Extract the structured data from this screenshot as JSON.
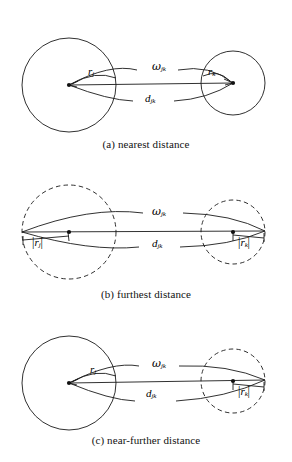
{
  "figure": {
    "type": "diagram",
    "background_color": "#ffffff",
    "stroke_color": "#1a1a1a"
  },
  "panels": [
    {
      "id": "a",
      "caption": "(a) nearest distance",
      "left_circle": {
        "style": "solid",
        "cx": 69,
        "cy": 85,
        "r": 47,
        "center_dot": true
      },
      "right_circle": {
        "style": "solid",
        "cx": 233,
        "cy": 83,
        "r": 32,
        "center_dot": true
      },
      "labels": {
        "left_radius": "r",
        "left_radius_sub": "j",
        "right_radius": "r",
        "right_radius_sub": "k",
        "omega": "ω",
        "omega_sub": "jk",
        "distance": "d",
        "distance_sub": "jk"
      }
    },
    {
      "id": "b",
      "caption": "(b) furthest distance",
      "left_circle": {
        "style": "dashed",
        "cx": 69,
        "cy": 232,
        "r": 47,
        "center_dot": true
      },
      "right_circle": {
        "style": "dashed",
        "cx": 233,
        "cy": 232,
        "r": 32,
        "center_dot": true
      },
      "labels": {
        "left_radius": "|r",
        "left_radius_sub": "j",
        "left_radius_close": "|",
        "right_radius": "|r",
        "right_radius_sub": "k",
        "right_radius_close": "|",
        "omega": "ω",
        "omega_sub": "jk",
        "distance": "d",
        "distance_sub": "jk"
      }
    },
    {
      "id": "c",
      "caption": "(c) near-further distance",
      "left_circle": {
        "style": "solid",
        "cx": 69,
        "cy": 383,
        "r": 47,
        "center_dot": true
      },
      "right_circle": {
        "style": "dashed",
        "cx": 233,
        "cy": 381,
        "r": 32,
        "center_dot": true
      },
      "labels": {
        "left_radius": "r",
        "left_radius_sub": "j",
        "right_radius": "|r",
        "right_radius_sub": "k",
        "right_radius_close": "|",
        "omega": "ω",
        "omega_sub": "jk",
        "distance": "d",
        "distance_sub": "jk"
      }
    }
  ],
  "symbols": {
    "omega_char": "ω",
    "d_char": "d",
    "r_char": "r",
    "sub_j": "j",
    "sub_k": "k",
    "sub_jk": "jk",
    "abs_bar": "|"
  }
}
